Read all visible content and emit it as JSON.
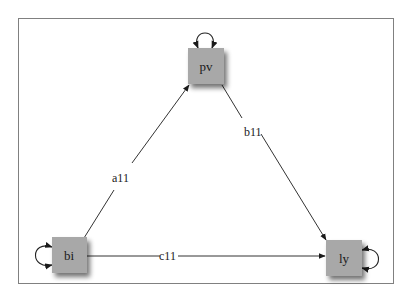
{
  "diagram": {
    "type": "path-diagram",
    "frame": {
      "x": 18,
      "y": 18,
      "w": 376,
      "h": 266,
      "color": "#808080"
    },
    "node_style": {
      "fill": "#a8a8a8",
      "shadow": "#777777",
      "size": 36
    },
    "nodes": [
      {
        "id": "pv",
        "label": "pv",
        "x": 188,
        "y": 48,
        "self_loop": "top"
      },
      {
        "id": "bi",
        "label": "bi",
        "x": 52,
        "y": 237,
        "self_loop": "left"
      },
      {
        "id": "ly",
        "label": "ly",
        "x": 326,
        "y": 240,
        "self_loop": "right"
      }
    ],
    "edges": [
      {
        "from": "bi",
        "to": "pv",
        "label": "a11"
      },
      {
        "from": "pv",
        "to": "ly",
        "label": "b11"
      },
      {
        "from": "bi",
        "to": "ly",
        "label": "c11"
      }
    ]
  }
}
